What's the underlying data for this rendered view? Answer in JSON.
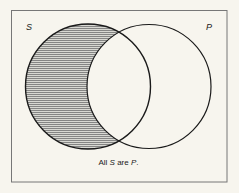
{
  "diagram": {
    "type": "venn",
    "sets": [
      {
        "id": "S",
        "label": "S",
        "cx": 88,
        "cy": 86.5,
        "r": 62.5,
        "shaded_region": "S minus P"
      },
      {
        "id": "P",
        "label": "P",
        "cx": 149,
        "cy": 86.5,
        "r": 62
      }
    ],
    "caption": {
      "prefix": "All ",
      "subject": "S",
      "middle": " are ",
      "predicate": "P",
      "suffix": "."
    },
    "colors": {
      "background": "#f7f5ee",
      "stroke": "#1a1a1a",
      "hatch": "#8a8a8a",
      "frame": "#777777"
    }
  }
}
